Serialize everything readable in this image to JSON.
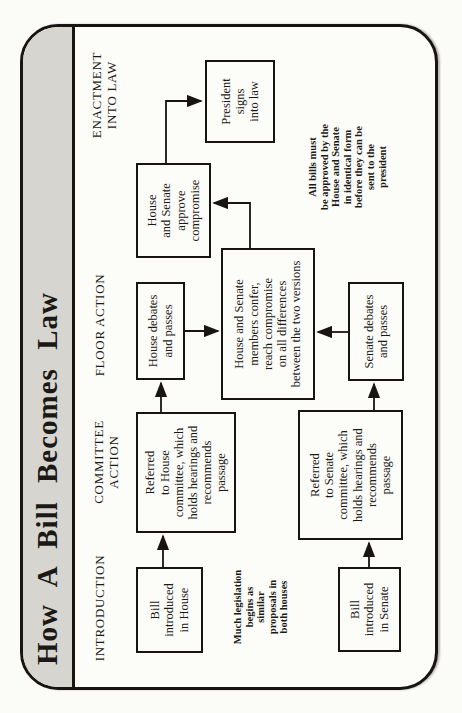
{
  "title": "How A Bill Becomes Law",
  "colors": {
    "band_gray": "#d7d5d0",
    "ink_black": "#171411",
    "paper_white": "#fcfcf9"
  },
  "stages": {
    "introduction": {
      "lines": [
        "INTRODUCTION"
      ]
    },
    "committee_action": {
      "lines": [
        "COMMITTEE",
        "ACTION"
      ]
    },
    "floor_action": {
      "lines": [
        "FLOOR ACTION"
      ]
    },
    "enactment": {
      "lines": [
        "ENACTMENT",
        "INTO LAW"
      ]
    }
  },
  "boxes": {
    "bill_house": {
      "lines": [
        "Bill",
        "introduced",
        "in House"
      ]
    },
    "committee_house": {
      "lines": [
        "Referred",
        "to House",
        "committee, which",
        "holds hearings and",
        "recommends",
        "passage"
      ]
    },
    "debates_house": {
      "lines": [
        "House debates",
        "and passes"
      ]
    },
    "approve_compromise": {
      "lines": [
        "House",
        "and Senate",
        "approve",
        "compromise"
      ]
    },
    "president_signs": {
      "lines": [
        "President",
        "signs",
        "into law"
      ]
    },
    "confer": {
      "lines": [
        "House and Senate",
        "members confer,",
        "reach compromise",
        "on all differences",
        "between the two versions"
      ]
    },
    "bill_senate": {
      "lines": [
        "Bill",
        "introduced",
        "in Senate"
      ]
    },
    "committee_senate": {
      "lines": [
        "Referred",
        "to Senate",
        "committee, which",
        "holds hearings and",
        "recommends",
        "passage"
      ]
    },
    "debates_senate": {
      "lines": [
        "Senate debates",
        "and passes"
      ]
    }
  },
  "notes": {
    "similar_proposals": {
      "lines": [
        "Much legislation",
        "begins as",
        "similar",
        "proposals in",
        "both houses"
      ]
    },
    "identical_form": {
      "lines": [
        "All bills must",
        "be approved by the",
        "House and Senate",
        "in identical form",
        "before they can be",
        "sent to the",
        "president"
      ]
    }
  },
  "flow_edges": [
    {
      "from": "bill_house",
      "to": "committee_house"
    },
    {
      "from": "committee_house",
      "to": "debates_house"
    },
    {
      "from": "debates_house",
      "to": "confer"
    },
    {
      "from": "bill_senate",
      "to": "committee_senate"
    },
    {
      "from": "committee_senate",
      "to": "debates_senate"
    },
    {
      "from": "debates_senate",
      "to": "confer"
    },
    {
      "from": "confer",
      "to": "approve_compromise"
    },
    {
      "from": "approve_compromise",
      "to": "president_signs"
    }
  ]
}
